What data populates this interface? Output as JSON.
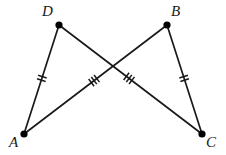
{
  "figure": {
    "width": 226,
    "height": 155,
    "background_color": "#ffffff",
    "stroke_color": "#1a1a1a",
    "vertex_color": "#000000"
  },
  "vertices": [
    {
      "id": "D",
      "label": "D",
      "x": 59,
      "y": 25,
      "label_x": 42,
      "label_y": 4,
      "dot_radius": 3.6
    },
    {
      "id": "B",
      "label": "B",
      "x": 167,
      "y": 25,
      "label_x": 171,
      "label_y": 4,
      "dot_radius": 3.6
    },
    {
      "id": "A",
      "label": "A",
      "x": 24,
      "y": 134,
      "label_x": 9,
      "label_y": 135,
      "dot_radius": 3.6
    },
    {
      "id": "C",
      "label": "C",
      "x": 202,
      "y": 134,
      "label_x": 206,
      "label_y": 135,
      "dot_radius": 3.6
    }
  ],
  "segments": [
    {
      "id": "DA",
      "from": "D",
      "to": "A",
      "x1": 59,
      "y1": 25,
      "x2": 24,
      "y2": 134,
      "tick_count": 2,
      "tick_t": 0.49,
      "tick_len": 9,
      "tick_gap": 3.6
    },
    {
      "id": "BC",
      "from": "B",
      "to": "C",
      "x1": 167,
      "y1": 25,
      "x2": 202,
      "y2": 134,
      "tick_count": 2,
      "tick_t": 0.49,
      "tick_len": 9,
      "tick_gap": 3.6
    },
    {
      "id": "AB",
      "from": "A",
      "to": "B",
      "x1": 24,
      "y1": 134,
      "x2": 167,
      "y2": 25,
      "tick_count": 3,
      "tick_t": 0.49,
      "tick_len": 9,
      "tick_gap": 3.4
    },
    {
      "id": "DC",
      "from": "D",
      "to": "C",
      "x1": 59,
      "y1": 25,
      "x2": 202,
      "y2": 134,
      "tick_count": 3,
      "tick_t": 0.49,
      "tick_len": 9,
      "tick_gap": 3.4
    }
  ],
  "intersection": {
    "x": 113,
    "y": 66,
    "marked": false
  },
  "congruence_marks": {
    "double_tick_segments": [
      "DA",
      "BC"
    ],
    "triple_tick_segments": [
      "AB",
      "DC"
    ]
  }
}
